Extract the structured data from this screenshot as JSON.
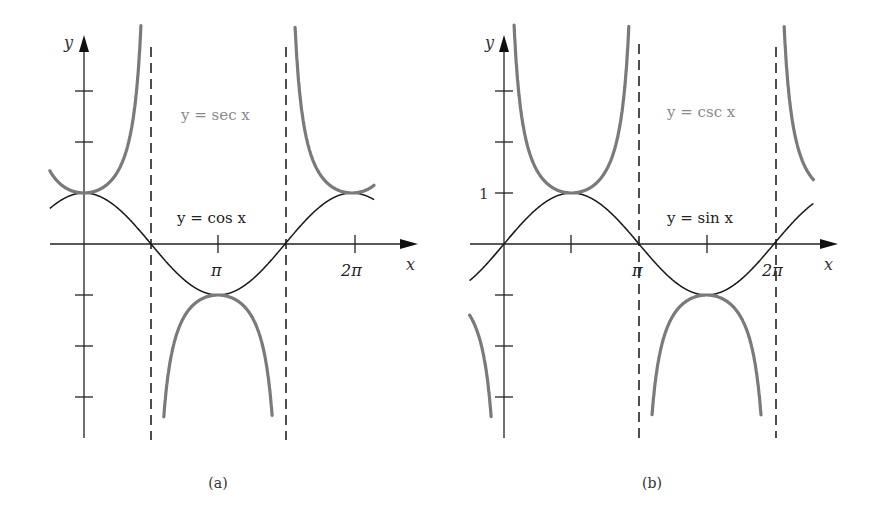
{
  "figure": {
    "panels": [
      {
        "id": "a",
        "caption": "(a)",
        "axis_x_label": "x",
        "axis_y_label": "y",
        "x_tick_labels": [
          "π",
          "2π"
        ],
        "label_sec": "y = sec x",
        "label_cos": "y = cos x"
      },
      {
        "id": "b",
        "caption": "(b)",
        "axis_x_label": "x",
        "axis_y_label": "y",
        "x_tick_labels": [
          "π",
          "2π"
        ],
        "y_tick_labels": [
          "1"
        ],
        "label_csc": "y = csc x",
        "label_sin": "y = sin x"
      }
    ],
    "colors": {
      "reciprocal_curve": "#7a7a7a",
      "base_curve": "#1a1a1a",
      "axis": "#222222",
      "label_gray": "#8a8a8a"
    }
  },
  "chart_data": [
    {
      "type": "line",
      "title": "(a)",
      "xlabel": "x",
      "ylabel": "y",
      "x_ticks": [
        "π",
        "2π"
      ],
      "xlim": [
        -0.8,
        7.4
      ],
      "ylim": [
        -4,
        4
      ],
      "grid": false,
      "asymptotes_x": [
        "π/2",
        "3π/2"
      ],
      "series": [
        {
          "name": "y = cos x",
          "function": "cos(x)",
          "x_range": [
            -0.8,
            6.8
          ]
        },
        {
          "name": "y = sec x",
          "function": "sec(x)",
          "x_range": [
            -0.8,
            6.8
          ],
          "clip_y": [
            -3.4,
            4.3
          ]
        }
      ]
    },
    {
      "type": "line",
      "title": "(b)",
      "xlabel": "x",
      "ylabel": "y",
      "x_ticks": [
        "π",
        "2π"
      ],
      "y_ticks": [
        "1"
      ],
      "xlim": [
        -0.8,
        7.7
      ],
      "ylim": [
        -4,
        4
      ],
      "grid": false,
      "asymptotes_x": [
        "π",
        "2π"
      ],
      "series": [
        {
          "name": "y = sin x",
          "function": "sin(x)",
          "x_range": [
            -0.8,
            7.2
          ]
        },
        {
          "name": "y = csc x",
          "function": "csc(x)",
          "x_range": [
            -0.8,
            7.2
          ],
          "clip_y": [
            -3.4,
            4.3
          ]
        }
      ]
    }
  ]
}
